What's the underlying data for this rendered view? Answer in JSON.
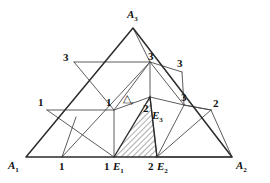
{
  "figure": {
    "name": "simplicial-subdivision-triangle",
    "colors": {
      "line": "#3a3a3a",
      "outline": "#2b2b2b",
      "hatch": "#4a4a4a",
      "background": "#ffffff"
    },
    "corners": {
      "apex": "A",
      "apex_sub": "3",
      "left": "A",
      "left_sub": "1",
      "right": "A",
      "right_sub": "2"
    },
    "edge_points": {
      "bottom_left": "1",
      "bottom_mid": "1",
      "bottom_mid_e": "E",
      "bottom_mid_e_sub": "1",
      "bottom_right": "2",
      "bottom_right_e": "E",
      "bottom_right_e_sub": "2",
      "interior_e": "E",
      "interior_e_sub": "3"
    },
    "vertex_labels": [
      {
        "id": "v-left-1",
        "text": "1"
      },
      {
        "id": "v-mid-1",
        "text": "1"
      },
      {
        "id": "v-upper-left-3",
        "text": "3"
      },
      {
        "id": "v-center-3",
        "text": "3"
      },
      {
        "id": "v-upper-right-3",
        "text": "3"
      },
      {
        "id": "v-right-3",
        "text": "3"
      },
      {
        "id": "v-right-2",
        "text": "2"
      },
      {
        "id": "v-hatch-2",
        "text": "2"
      },
      {
        "id": "v-bottom-1a",
        "text": "1"
      },
      {
        "id": "v-bottom-1b",
        "text": "1"
      },
      {
        "id": "v-bottom-2",
        "text": "2"
      }
    ],
    "region_label": {
      "symbol": "△",
      "subscript": "r"
    }
  }
}
